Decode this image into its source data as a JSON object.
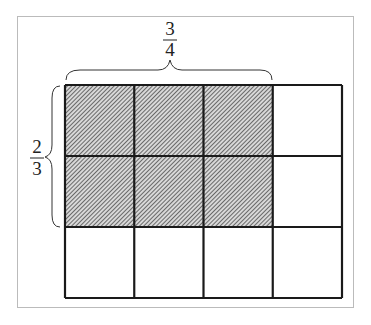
{
  "diagram": {
    "columns": 4,
    "rows": 3,
    "shaded_columns": 3,
    "shaded_rows": 2,
    "top_fraction": {
      "numerator": "3",
      "denominator": "4"
    },
    "left_fraction": {
      "numerator": "2",
      "denominator": "3"
    },
    "colors": {
      "line": "#1a1a1a",
      "shade": "#555555",
      "frame": "#bbbbbb"
    }
  }
}
